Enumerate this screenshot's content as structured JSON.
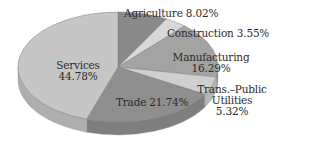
{
  "chart_data": {
    "type": "pie",
    "title": "",
    "style": "3d-pie",
    "start_angle_deg": -90,
    "direction": "clockwise",
    "categories": [
      "Agriculture",
      "Construction",
      "Manufacturing",
      "Trans.-Public Utilities",
      "Trade",
      "Services"
    ],
    "values": [
      8.02,
      3.55,
      16.29,
      5.32,
      21.74,
      44.78
    ],
    "colors": [
      "#8a8a8a",
      "#d8d8d8",
      "#a3a3a3",
      "#cfcfcf",
      "#8f8f8f",
      "#c6c6c6"
    ],
    "labels": [
      {
        "name": "Agriculture",
        "text": "Agriculture 8.02%"
      },
      {
        "name": "Construction",
        "text": "Construction 3.55%"
      },
      {
        "name": "Manufacturing",
        "line1": "Manufacturing",
        "line2": "16.29%"
      },
      {
        "name": "Trans.-Public Utilities",
        "line1": "Trans.–Public",
        "line2": "Utilities",
        "line3": "5.32%"
      },
      {
        "name": "Trade",
        "text": "Trade 21.74%"
      },
      {
        "name": "Services",
        "line1": "Services",
        "line2": "44.78%"
      }
    ]
  }
}
